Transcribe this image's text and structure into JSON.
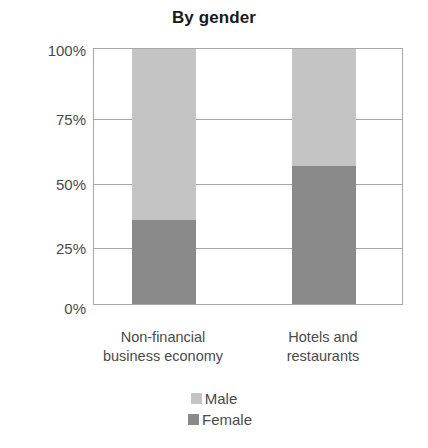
{
  "chart_data": {
    "type": "bar",
    "title": "By gender",
    "xlabel": "",
    "ylabel": "",
    "ylim": [
      0,
      100
    ],
    "stacked": true,
    "grid": true,
    "legend_position": "bottom",
    "categories": [
      "Non-financial business economy",
      "Hotels and restaurants"
    ],
    "category_lines": [
      [
        "Non-financial",
        "business economy"
      ],
      [
        "Hotels and",
        "restaurants"
      ]
    ],
    "ytick_labels": [
      "100%",
      "75%",
      "50%",
      "25%",
      "0%"
    ],
    "ytick_values": [
      100,
      75,
      50,
      25,
      0
    ],
    "series": [
      {
        "name": "Male",
        "color": "#c4c4c4",
        "values": [
          67,
          46
        ]
      },
      {
        "name": "Female",
        "color": "#8a8a8a",
        "values": [
          33,
          54
        ]
      }
    ]
  },
  "legend": {
    "items": [
      {
        "label": "Male",
        "color": "#c4c4c4"
      },
      {
        "label": "Female",
        "color": "#8a8a8a"
      }
    ]
  }
}
